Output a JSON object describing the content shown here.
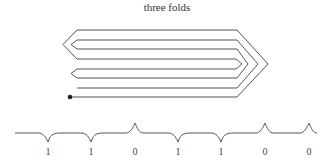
{
  "title": "three folds",
  "colors": {
    "stroke": "#555555",
    "text": "#333333",
    "background": "#ffffff"
  },
  "fold_diagram": {
    "description": "strip folded three times, shown as nested chevron layers with start dot",
    "start_dot": [
      70,
      97
    ]
  },
  "sequence": {
    "labels": [
      "1",
      "1",
      "0",
      "1",
      "1",
      "0",
      "0"
    ],
    "marks": [
      "valley",
      "valley",
      "peak",
      "valley",
      "valley",
      "peak",
      "peak"
    ],
    "positions_x": [
      48,
      91,
      135,
      178,
      221,
      265,
      309
    ]
  }
}
